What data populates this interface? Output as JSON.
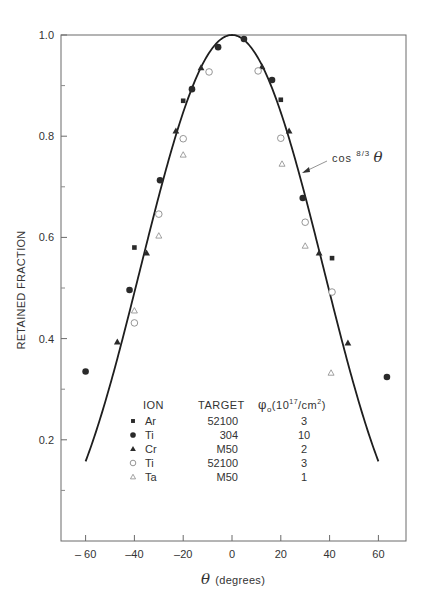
{
  "chart_data": {
    "type": "scatter",
    "title": "",
    "xlabel": "θ (degrees)",
    "ylabel": "RETAINED FRACTION",
    "xlim": [
      -70,
      70
    ],
    "ylim": [
      0.0,
      1.0
    ],
    "x_ticks": [
      -60,
      -40,
      -20,
      0,
      20,
      40,
      60
    ],
    "x_tick_labels": [
      "– 60",
      "–40",
      "–20",
      "0",
      "20",
      "40",
      "60"
    ],
    "y_ticks": [
      0.2,
      0.4,
      0.6,
      0.8,
      1.0
    ],
    "y_tick_labels": [
      "0.2",
      "0.4",
      "0.6",
      "0.8",
      "1.0"
    ],
    "y_minor_ticks": [
      0.1,
      0.3,
      0.5,
      0.7,
      0.9
    ],
    "grid": false,
    "fit_curve": {
      "label": "cos",
      "exponent_label": "8/3",
      "variable_label": "θ",
      "formula": "cos^(8/3)(θ)",
      "x_range": [
        -60,
        60
      ]
    },
    "legend": {
      "headers": {
        "ion": "ION",
        "target": "TARGET",
        "fluence": "φo(10^17/cm^2)"
      },
      "fluence_symbol": "φ",
      "fluence_sub": "o",
      "fluence_unit_pre": "(10",
      "fluence_exp": "17",
      "fluence_unit_mid": "/cm",
      "fluence_exp2": "2",
      "fluence_unit_post": ")",
      "position": "lower-center"
    },
    "series": [
      {
        "name": "Ar",
        "target": "52100",
        "fluence": "3",
        "marker": "filled-square",
        "points": [
          [
            -40,
            0.58
          ],
          [
            -20,
            0.87
          ],
          [
            20,
            0.872
          ],
          [
            41,
            0.559
          ]
        ]
      },
      {
        "name": "Ti",
        "target": "304",
        "fluence": "10",
        "marker": "filled-circle",
        "points": [
          [
            -60,
            0.335
          ],
          [
            -42,
            0.496
          ],
          [
            -29.5,
            0.713
          ],
          [
            -16.4,
            0.893
          ],
          [
            -5.7,
            0.976
          ],
          [
            4.9,
            0.992
          ],
          [
            16.4,
            0.911
          ],
          [
            29,
            0.678
          ],
          [
            63.5,
            0.324
          ]
        ]
      },
      {
        "name": "Cr",
        "target": "M50",
        "fluence": "2",
        "marker": "filled-triangle",
        "points": [
          [
            -47,
            0.393
          ],
          [
            -35,
            0.569
          ],
          [
            -23,
            0.81
          ],
          [
            -12.7,
            0.935
          ],
          [
            12.3,
            0.937
          ],
          [
            23.4,
            0.81
          ],
          [
            35.7,
            0.569
          ],
          [
            47.5,
            0.391
          ]
        ]
      },
      {
        "name": "Ti",
        "target": "52100",
        "fluence": "3",
        "marker": "open-circle",
        "points": [
          [
            -40,
            0.431
          ],
          [
            -30,
            0.646
          ],
          [
            -20,
            0.795
          ],
          [
            -9.4,
            0.927
          ],
          [
            10.7,
            0.929
          ],
          [
            20,
            0.796
          ],
          [
            30,
            0.63
          ],
          [
            41,
            0.492
          ]
        ]
      },
      {
        "name": "Ta",
        "target": "M50",
        "fluence": "1",
        "marker": "open-triangle",
        "points": [
          [
            -40,
            0.455
          ],
          [
            -30,
            0.603
          ],
          [
            -20,
            0.763
          ],
          [
            20.5,
            0.745
          ],
          [
            30,
            0.583
          ],
          [
            40.6,
            0.332
          ]
        ]
      }
    ]
  },
  "style": {
    "ink": "#2a2a2a",
    "open_marker": "#8a8a8a",
    "axis": "#555555"
  }
}
